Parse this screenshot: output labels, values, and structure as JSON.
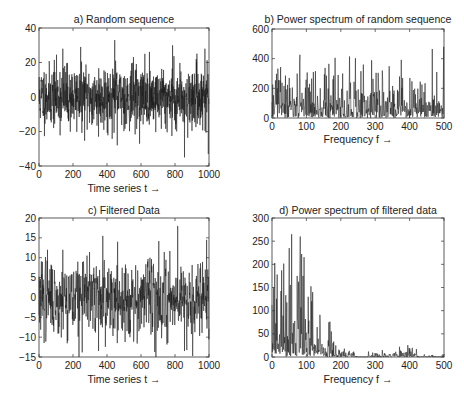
{
  "figure": {
    "background": "#ffffff",
    "line_color": "#1a1a1a",
    "axis_color": "#333333"
  },
  "chart_data": [
    {
      "id": "a",
      "type": "line",
      "title": "a) Random sequence",
      "xlabel": "Time series t →",
      "ylabel": "",
      "xlim": [
        0,
        1000
      ],
      "ylim": [
        -40,
        40
      ],
      "xticks": [
        0,
        200,
        400,
        600,
        800,
        1000
      ],
      "yticks": [
        -40,
        -20,
        0,
        20,
        40
      ],
      "xtick_labels": [
        "0",
        "200",
        "400",
        "600",
        "800",
        "1000"
      ],
      "ytick_labels": [
        "−40",
        "−20",
        "0",
        "20",
        "40"
      ],
      "n_points": 1000,
      "amplitude": 9,
      "seed": 11,
      "notable_points": [
        {
          "x": 140,
          "y": 28
        },
        {
          "x": 245,
          "y": 29
        },
        {
          "x": 445,
          "y": 33
        },
        {
          "x": 785,
          "y": 30
        },
        {
          "x": 975,
          "y": 28
        },
        {
          "x": 460,
          "y": -28
        },
        {
          "x": 855,
          "y": -35
        },
        {
          "x": 995,
          "y": -33
        },
        {
          "x": 350,
          "y": -23
        }
      ],
      "box": {
        "left": 39,
        "top": 28,
        "right": 209,
        "bottom": 166
      },
      "grid": false
    },
    {
      "id": "b",
      "type": "line",
      "title": "b) Power spectrum of random sequence",
      "xlabel": "Frequency f →",
      "ylabel": "",
      "xlim": [
        0,
        500
      ],
      "ylim": [
        0,
        600
      ],
      "xticks": [
        0,
        100,
        200,
        300,
        400,
        500
      ],
      "yticks": [
        0,
        200,
        400,
        600
      ],
      "xtick_labels": [
        "0",
        "100",
        "200",
        "300",
        "400",
        "500"
      ],
      "ytick_labels": [
        "0",
        "200",
        "400",
        "600"
      ],
      "n_points": 500,
      "seed": 23,
      "notable_points": [
        {
          "x": 50,
          "y": 270
        },
        {
          "x": 80,
          "y": 370
        },
        {
          "x": 120,
          "y": 310
        },
        {
          "x": 165,
          "y": 365
        },
        {
          "x": 205,
          "y": 300
        },
        {
          "x": 225,
          "y": 415
        },
        {
          "x": 265,
          "y": 360
        },
        {
          "x": 320,
          "y": 320
        },
        {
          "x": 370,
          "y": 280
        },
        {
          "x": 400,
          "y": 270
        },
        {
          "x": 430,
          "y": 245
        },
        {
          "x": 465,
          "y": 465
        },
        {
          "x": 478,
          "y": 310
        }
      ],
      "box": {
        "left": 272,
        "top": 29,
        "right": 444,
        "bottom": 118
      },
      "grid": false
    },
    {
      "id": "c",
      "type": "line",
      "title": "c) Filtered Data",
      "xlabel": "Time series t →",
      "ylabel": "",
      "xlim": [
        0,
        1000
      ],
      "ylim": [
        -15,
        20
      ],
      "xticks": [
        0,
        200,
        400,
        600,
        800,
        1000
      ],
      "yticks": [
        -15,
        -10,
        -5,
        0,
        5,
        10,
        15,
        20
      ],
      "xtick_labels": [
        "0",
        "200",
        "400",
        "600",
        "800",
        "1000"
      ],
      "ytick_labels": [
        "−15",
        "−10",
        "−5",
        "0",
        "5",
        "10",
        "15",
        "20"
      ],
      "n_points": 1000,
      "amplitude": 4.5,
      "seed": 37,
      "notable_points": [
        {
          "x": 50,
          "y": 12
        },
        {
          "x": 140,
          "y": 12
        },
        {
          "x": 235,
          "y": -15
        },
        {
          "x": 375,
          "y": 15.5
        },
        {
          "x": 350,
          "y": -13.5
        },
        {
          "x": 460,
          "y": -11.5
        },
        {
          "x": 815,
          "y": 18
        },
        {
          "x": 855,
          "y": -13.5
        },
        {
          "x": 985,
          "y": 14.5
        }
      ],
      "box": {
        "left": 39,
        "top": 218,
        "right": 209,
        "bottom": 357
      },
      "grid": false
    },
    {
      "id": "d",
      "type": "line",
      "title": "d) Power spectrum of filtered data",
      "xlabel": "Frequency f →",
      "ylabel": "",
      "xlim": [
        0,
        500
      ],
      "ylim": [
        0,
        300
      ],
      "xticks": [
        0,
        100,
        200,
        300,
        400,
        500
      ],
      "yticks": [
        0,
        50,
        100,
        150,
        200,
        250,
        300
      ],
      "xtick_labels": [
        "0",
        "100",
        "200",
        "300",
        "400",
        "500"
      ],
      "ytick_labels": [
        "0",
        "50",
        "100",
        "150",
        "200",
        "250",
        "300"
      ],
      "n_points": 500,
      "seed": 53,
      "notable_points": [
        {
          "x": 5,
          "y": 150
        },
        {
          "x": 15,
          "y": 178
        },
        {
          "x": 28,
          "y": 187
        },
        {
          "x": 50,
          "y": 235
        },
        {
          "x": 57,
          "y": 265
        },
        {
          "x": 73,
          "y": 175
        },
        {
          "x": 82,
          "y": 260
        },
        {
          "x": 90,
          "y": 175
        },
        {
          "x": 105,
          "y": 130
        },
        {
          "x": 118,
          "y": 140
        },
        {
          "x": 140,
          "y": 70
        },
        {
          "x": 165,
          "y": 75
        },
        {
          "x": 185,
          "y": 25
        },
        {
          "x": 320,
          "y": 15
        },
        {
          "x": 370,
          "y": 22
        },
        {
          "x": 400,
          "y": 18
        }
      ],
      "box": {
        "left": 272,
        "top": 218,
        "right": 444,
        "bottom": 357
      },
      "grid": false
    }
  ]
}
